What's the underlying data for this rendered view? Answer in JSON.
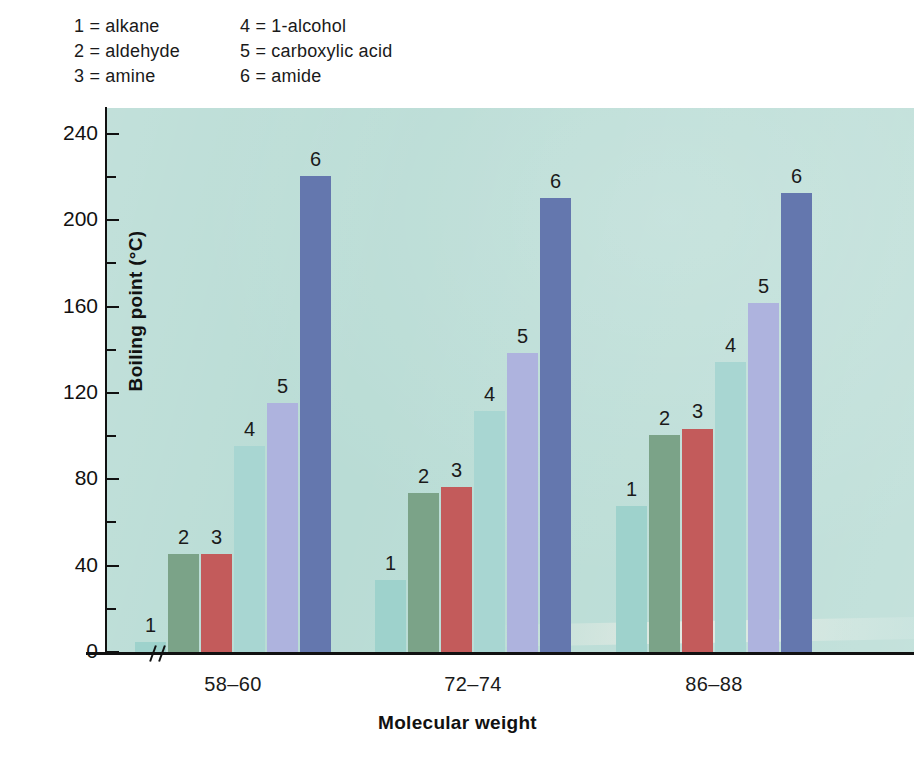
{
  "legend": {
    "entries": [
      {
        "key": "1",
        "text": "1 = alkane"
      },
      {
        "key": "4",
        "text": "4 = 1-alcohol"
      },
      {
        "key": "2",
        "text": "2 = aldehyde"
      },
      {
        "key": "5",
        "text": "5 = carboxylic acid"
      },
      {
        "key": "3",
        "text": "3 = amine"
      },
      {
        "key": "6",
        "text": "6 = amide"
      }
    ]
  },
  "axes": {
    "y_title": "Boiling point (°C)",
    "x_title": "Molecular weight",
    "y_major_ticks": [
      "0",
      "40",
      "80",
      "120",
      "160",
      "200",
      "240"
    ],
    "y_break_marker": "≠"
  },
  "chart_data": {
    "type": "bar",
    "title": "",
    "xlabel": "Molecular weight",
    "ylabel": "Boiling point (°C)",
    "ylim": [
      0,
      252
    ],
    "ytick_values": [
      0,
      40,
      80,
      120,
      160,
      200,
      240
    ],
    "minor_tick_interval": 20,
    "grid": false,
    "legend_position": "above-plot",
    "axis_break_on_x": true,
    "categories": [
      "58–60",
      "72–74",
      "86–88"
    ],
    "series": [
      {
        "name": "1 = alkane",
        "code": "1",
        "color": "#9ed2cc",
        "values": [
          5,
          34,
          68
        ]
      },
      {
        "name": "2 = aldehyde",
        "code": "2",
        "color": "#7ba388",
        "values": [
          46,
          74,
          101
        ]
      },
      {
        "name": "3 = amine",
        "code": "3",
        "color": "#c35b5b",
        "values": [
          46,
          77,
          104
        ]
      },
      {
        "name": "4 = 1-alcohol",
        "code": "4",
        "color": "#a8d6d2",
        "values": [
          96,
          112,
          135
        ]
      },
      {
        "name": "5 = carboxylic acid",
        "code": "5",
        "color": "#aeb3de",
        "values": [
          116,
          139,
          162
        ]
      },
      {
        "name": "6 = amide",
        "code": "6",
        "color": "#6477ae",
        "values": [
          221,
          211,
          213
        ]
      }
    ]
  },
  "colors": {
    "plot_background": "#b9dcd5",
    "page_background": "#ffffff",
    "axis": "#111111",
    "text": "#1a1a1a"
  }
}
